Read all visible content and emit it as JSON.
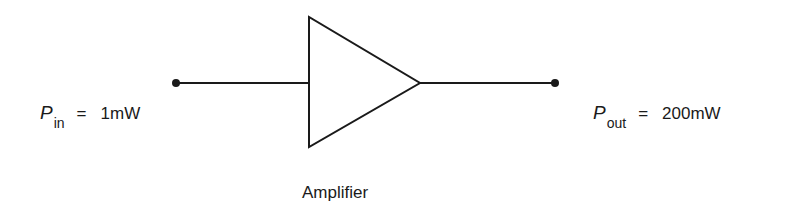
{
  "diagram": {
    "input": {
      "symbol": "P",
      "subscript": "in",
      "equals": "=",
      "value": "1mW"
    },
    "output": {
      "symbol": "P",
      "subscript": "out",
      "equals": "=",
      "value": "200mW"
    },
    "block": {
      "label": "Amplifier",
      "shape": "triangle-amplifier-icon"
    },
    "colors": {
      "line": "#1a1a1a",
      "background": "#ffffff"
    }
  }
}
